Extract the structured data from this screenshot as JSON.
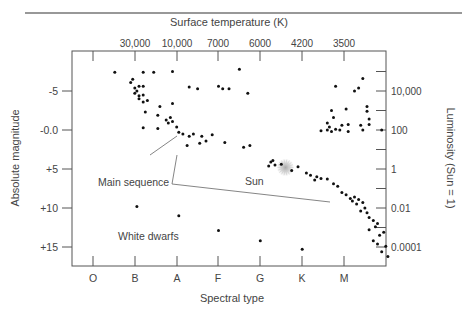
{
  "chart_data": {
    "type": "scatter",
    "title": "",
    "top_axis_title": "Surface temperature (K)",
    "top_tick_labels": [
      "30,000",
      "10,000",
      "7000",
      "6000",
      "4200",
      "3500"
    ],
    "xlabel": "Spectral type",
    "x_categories": [
      "O",
      "B",
      "A",
      "F",
      "G",
      "K",
      "M"
    ],
    "ylabel": "Absolute magnitude",
    "y_tick_labels": [
      "-5",
      "-0.0",
      "+5",
      "+10",
      "+15"
    ],
    "y_ticks": [
      -5,
      0,
      5,
      10,
      15
    ],
    "ylim": [
      -8.2,
      17.4
    ],
    "y_inverted": true,
    "right_axis_title": "Luminosity (Sun = 1)",
    "right_tick_labels": [
      "10,000",
      "100",
      "1",
      "0.01",
      "0.0001"
    ],
    "grid": false,
    "annotations": [
      {
        "text": "Main sequence",
        "x": 1.35,
        "y": 8.7
      },
      {
        "text": "Sun",
        "x": 4.55,
        "y": 6.4
      },
      {
        "text": "White dwarfs",
        "x": 1.75,
        "y": 14.0
      }
    ],
    "sun": {
      "x": 4.6,
      "y": 4.8
    },
    "points": [
      [
        0.52,
        -7.4
      ],
      [
        0.9,
        -6.1
      ],
      [
        0.95,
        -6.5
      ],
      [
        1.2,
        -7.4
      ],
      [
        1.45,
        -7.4
      ],
      [
        1.9,
        -7.5
      ],
      [
        3.5,
        -7.8
      ],
      [
        1.0,
        -5.4
      ],
      [
        1.1,
        -5.6
      ],
      [
        1.2,
        -5.6
      ],
      [
        1.05,
        -5.0
      ],
      [
        1.0,
        -4.7
      ],
      [
        1.1,
        -4.4
      ],
      [
        1.2,
        -4.5
      ],
      [
        1.1,
        -4.0
      ],
      [
        1.2,
        -3.6
      ],
      [
        1.3,
        -3.8
      ],
      [
        1.25,
        -2.3
      ],
      [
        1.2,
        -0.3
      ],
      [
        1.55,
        -0.2
      ],
      [
        1.6,
        -3.0
      ],
      [
        1.9,
        -3.4
      ],
      [
        1.55,
        -1.9
      ],
      [
        1.75,
        -1.3
      ],
      [
        1.8,
        -0.9
      ],
      [
        1.85,
        -1.6
      ],
      [
        1.9,
        -1.1
      ],
      [
        2.0,
        -0.4
      ],
      [
        2.05,
        0.3
      ],
      [
        2.15,
        0.5
      ],
      [
        2.3,
        0.8
      ],
      [
        2.4,
        0.5
      ],
      [
        2.6,
        0.8
      ],
      [
        2.25,
        2.0
      ],
      [
        2.7,
        1.4
      ],
      [
        2.55,
        1.7
      ],
      [
        2.3,
        -5.5
      ],
      [
        2.5,
        -5.3
      ],
      [
        3.0,
        -5.6
      ],
      [
        3.25,
        -5.3
      ],
      [
        3.1,
        -5.3
      ],
      [
        3.7,
        -4.7
      ],
      [
        2.85,
        0.6
      ],
      [
        3.15,
        1.6
      ],
      [
        3.6,
        2.2
      ],
      [
        3.75,
        2.0
      ],
      [
        4.3,
        3.9
      ],
      [
        4.35,
        4.5
      ],
      [
        4.2,
        4.6
      ],
      [
        4.5,
        4.4
      ],
      [
        4.25,
        4.1
      ],
      [
        4.75,
        5.2
      ],
      [
        4.9,
        4.7
      ],
      [
        5.1,
        5.5
      ],
      [
        5.2,
        5.8
      ],
      [
        5.35,
        6.0
      ],
      [
        5.45,
        6.2
      ],
      [
        5.6,
        6.3
      ],
      [
        5.75,
        6.9
      ],
      [
        5.85,
        7.2
      ],
      [
        5.3,
        6.4
      ],
      [
        5.95,
        8.0
      ],
      [
        6.05,
        8.3
      ],
      [
        6.15,
        8.8
      ],
      [
        6.2,
        9.1
      ],
      [
        6.25,
        8.6
      ],
      [
        6.35,
        8.9
      ],
      [
        6.3,
        9.5
      ],
      [
        6.45,
        9.3
      ],
      [
        6.5,
        10.0
      ],
      [
        6.55,
        10.6
      ],
      [
        6.4,
        10.4
      ],
      [
        6.6,
        11.2
      ],
      [
        6.7,
        11.6
      ],
      [
        6.8,
        12.0
      ],
      [
        6.75,
        12.4
      ],
      [
        6.6,
        12.8
      ],
      [
        6.85,
        13.5
      ],
      [
        6.95,
        13.1
      ],
      [
        6.7,
        14.2
      ],
      [
        6.8,
        14.6
      ],
      [
        7.0,
        14.9
      ],
      [
        6.9,
        15.6
      ],
      [
        7.05,
        16.2
      ],
      [
        5.75,
        -1.6
      ],
      [
        5.8,
        -5.6
      ],
      [
        6.35,
        -5.4
      ],
      [
        6.25,
        -5.0
      ],
      [
        6.55,
        -3.0
      ],
      [
        6.45,
        -6.6
      ],
      [
        6.6,
        -1.4
      ],
      [
        5.6,
        -0.9
      ],
      [
        5.6,
        0.0
      ],
      [
        5.7,
        0.2
      ],
      [
        5.8,
        -0.1
      ],
      [
        5.9,
        0.0
      ],
      [
        5.95,
        -0.6
      ],
      [
        6.1,
        0.2
      ],
      [
        6.1,
        -0.7
      ],
      [
        6.4,
        -0.6
      ],
      [
        6.45,
        0.0
      ],
      [
        6.6,
        -0.7
      ],
      [
        6.9,
        0.0
      ],
      [
        5.45,
        0.1
      ],
      [
        5.65,
        -0.4
      ],
      [
        5.7,
        -2.5
      ],
      [
        6.05,
        -2.7
      ],
      [
        6.55,
        -2.4
      ],
      [
        1.05,
        9.8
      ],
      [
        2.05,
        11.0
      ],
      [
        3.0,
        12.9
      ],
      [
        4.0,
        14.2
      ],
      [
        5.0,
        15.3
      ]
    ]
  }
}
